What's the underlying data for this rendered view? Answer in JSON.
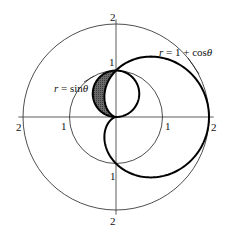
{
  "chart_data": {
    "type": "polar-diagram",
    "title": "",
    "center_px": [
      116,
      117
    ],
    "unit_px": 46.5,
    "reference_circles": [
      {
        "r": 1,
        "stroke": "#222222",
        "width": 0.8
      },
      {
        "r": 2,
        "stroke": "#222222",
        "width": 0.8
      }
    ],
    "axes": {
      "horizontal_extent": 2.1,
      "vertical_extent": 2.1,
      "stroke": "#333333"
    },
    "curves": [
      {
        "name": "cardioid",
        "equation": "r = 1 + cosθ",
        "label": "r = 1 + cosθ",
        "stroke": "#000000",
        "width": 2
      },
      {
        "name": "sine-circle",
        "equation": "r = sinθ",
        "label": "r = sinθ",
        "stroke": "#000000",
        "width": 2
      }
    ],
    "shaded_region": {
      "description": "region inside r = sinθ and outside r = 1 + cosθ",
      "theta_range": [
        "π/2",
        "π"
      ],
      "fill": "#5a5a5a"
    },
    "tick_labels": {
      "left_2": "2",
      "left_1": "1",
      "right_1": "1",
      "right_2": "2",
      "top_2": "2",
      "top_1": "1",
      "bottom_1": "1",
      "bottom_2": "2"
    }
  },
  "labels": {
    "cardioid": {
      "r": "r",
      "eq": " = 1 + cos",
      "theta": "θ"
    },
    "sine": {
      "r": "r",
      "eq": " = sin",
      "theta": "θ"
    }
  }
}
